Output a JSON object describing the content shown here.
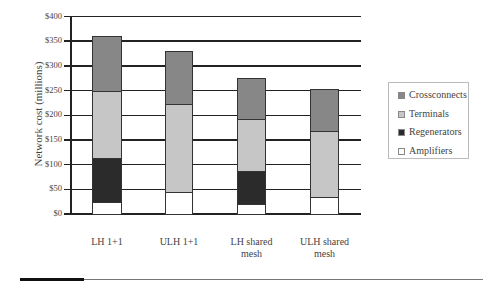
{
  "chart_data": {
    "type": "bar",
    "stacked": true,
    "title": "",
    "xlabel": "",
    "ylabel": "Network cost (millions)",
    "ylim": [
      0,
      400
    ],
    "yticks": [
      "$0",
      "$50",
      "$100",
      "$150",
      "$200",
      "$250",
      "$300",
      "$350",
      "$400"
    ],
    "categories": [
      "LH 1+1",
      "ULH 1+1",
      "LH shared mesh",
      "ULH shared mesh"
    ],
    "category_lines": [
      [
        "LH 1+1"
      ],
      [
        "ULH 1+1"
      ],
      [
        "LH shared",
        "mesh"
      ],
      [
        "ULH shared",
        "mesh"
      ]
    ],
    "series": [
      {
        "name": "Amplifiers",
        "color": "#ffffff",
        "values": [
          25,
          45,
          20,
          35
        ]
      },
      {
        "name": "Regenerators",
        "color": "#2b2b2b",
        "values": [
          88,
          0,
          67,
          0
        ]
      },
      {
        "name": "Terminals",
        "color": "#c6c6c6",
        "values": [
          137,
          178,
          105,
          133
        ]
      },
      {
        "name": "Crossconnects",
        "color": "#878787",
        "values": [
          110,
          107,
          83,
          85
        ]
      }
    ],
    "totals": [
      360,
      330,
      275,
      253
    ],
    "legend": {
      "position": "right",
      "entries": [
        "Crossconnects",
        "Terminals",
        "Regenerators",
        "Amplifiers"
      ]
    },
    "grid": true
  }
}
